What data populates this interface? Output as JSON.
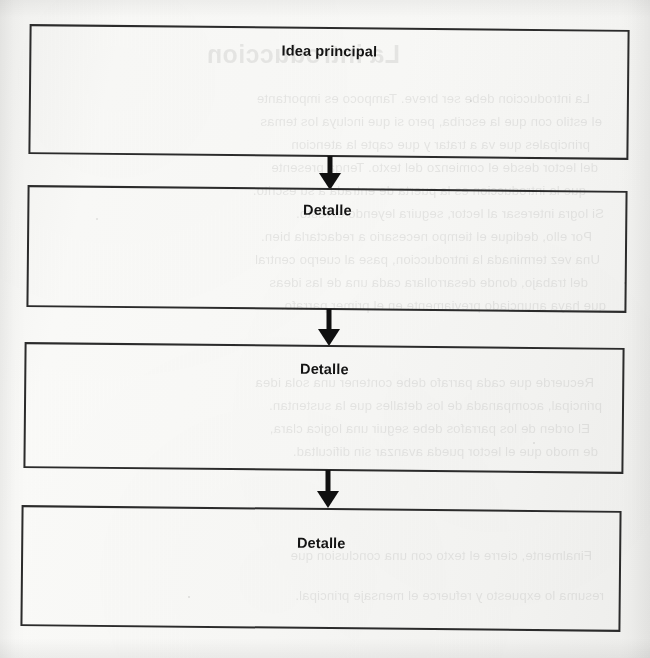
{
  "document": {
    "kind": "scanned-page",
    "diagram_type": "flowchart",
    "orientation": "vertical-top-down",
    "language": "es",
    "background_color": "#f7f7f5",
    "ink_color": "#2b2b2b",
    "label_color": "#141414"
  },
  "flowchart": {
    "title_node_label": "Idea principal",
    "nodes": [
      {
        "id": "node-1",
        "label": "Idea principal",
        "role": "main-idea"
      },
      {
        "id": "node-2",
        "label": "Detalle",
        "role": "detail"
      },
      {
        "id": "node-3",
        "label": "Detalle",
        "role": "detail"
      },
      {
        "id": "node-4",
        "label": "Detalle",
        "role": "detail"
      }
    ],
    "connectors": [
      {
        "id": "arrow-1",
        "from": "node-1",
        "to": "node-2",
        "direction": "down"
      },
      {
        "id": "arrow-2",
        "from": "node-2",
        "to": "node-3",
        "direction": "down"
      },
      {
        "id": "arrow-3",
        "from": "node-3",
        "to": "node-4",
        "direction": "down"
      }
    ]
  },
  "bleed_through": {
    "note": "faint mirrored text showing through from the reverse side of the sheet",
    "heading": "La introduccion",
    "lines": [
      "La introduccion debe ser breve. Tampoco es importante",
      "el estilo con que la escriba, pero si que incluya los temas",
      "principales que va a tratar y que capte la atencion",
      "del lector desde el comienzo del texto. Tenga presente",
      "que la introduccion es la puerta de entrada a su escrito.",
      "Si logra interesar al lector, seguira leyendo el resto.",
      "Por ello, dedique el tiempo necesario a redactarla bien.",
      "Una vez terminada la introduccion, pase al cuerpo central",
      "del trabajo, donde desarrollara cada una de las ideas",
      "que haya anunciado previamente en el primer parrafo.",
      "Recuerde que cada parrafo debe contener una sola idea",
      "principal, acompanada de los detalles que la sustentan.",
      "El orden de los parrafos debe seguir una logica clara,",
      "de modo que el lector pueda avanzar sin dificultad.",
      "Finalmente, cierre el texto con una conclusion que",
      "resuma lo expuesto y refuerce el mensaje principal."
    ]
  }
}
